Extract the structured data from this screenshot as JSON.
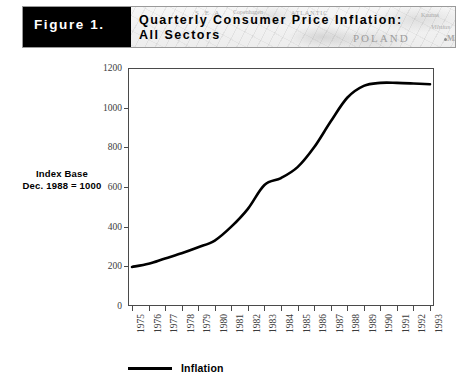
{
  "figure": {
    "tag": "Figure 1.",
    "title_line_1": "Quarterly Consumer Price Inflation:",
    "title_line_2": "All Sectors",
    "banner_map_labels": {
      "poland": "POLAND",
      "vilnius": "Vilnius",
      "minsk": "Minsk",
      "sea": "S E A",
      "copenhagen": "Copenhagen",
      "atlantic": "ATLANTIC",
      "kaunas": "Kaunas",
      "lithuania": "LITHUANIA"
    }
  },
  "annotations": {
    "index_base_line_1": "Index Base",
    "index_base_line_2": "Dec. 1988 = 1000"
  },
  "legend": {
    "series_label": "Inflation",
    "swatch_color": "#000000"
  },
  "chart_data": {
    "type": "line",
    "title": "Quarterly Consumer Price Inflation: All Sectors",
    "subtitle": "All Sectors",
    "xlabel": "",
    "ylabel": "",
    "ylim": [
      0,
      1200
    ],
    "y_ticks": [
      0,
      200,
      400,
      600,
      800,
      1000,
      1200
    ],
    "y_tick_labels": [
      "0",
      "200",
      "400",
      "600",
      "800",
      "1000",
      "1200"
    ],
    "grid": false,
    "legend_position": "bottom",
    "categories": [
      "1975",
      "1976",
      "1977",
      "1978",
      "1979",
      "1980",
      "1981",
      "1982",
      "1983",
      "1984",
      "1985",
      "1986",
      "1987",
      "1988",
      "1989",
      "1990",
      "1991",
      "1992",
      "1993"
    ],
    "series": [
      {
        "name": "Inflation",
        "color": "#000000",
        "values": [
          197,
          213,
          240,
          266,
          296,
          330,
          400,
          490,
          610,
          645,
          700,
          800,
          930,
          1050,
          1110,
          1125,
          1125,
          1122,
          1118
        ]
      }
    ],
    "note": "Index Base Dec. 1988 = 1000"
  }
}
